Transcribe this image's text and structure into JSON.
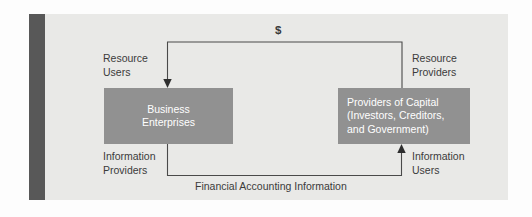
{
  "diagram": {
    "type": "flow-diagram",
    "colors": {
      "page_background": "#fdfdfd",
      "panel_background": "#e9e9e7",
      "accent_bar": "#585858",
      "node_fill": "#919191",
      "node_text": "#ffffff",
      "annotation_text": "#3b3b3b",
      "connector_line": "#4a4a4a"
    },
    "nodes": [
      {
        "id": "business-enterprises",
        "label": "Business\nEnterprises",
        "align": "center"
      },
      {
        "id": "providers-of-capital",
        "label": "Providers of Capital\n(Investors, Creditors,\nand Government)",
        "align": "left"
      }
    ],
    "annotations": {
      "resource_users": "Resource\nUsers",
      "resource_providers": "Resource\nProviders",
      "information_providers": "Information\nProviders",
      "information_users": "Information\nUsers",
      "money_flow": "$",
      "information_flow": "Financial Accounting Information"
    },
    "flows": [
      {
        "id": "capital-flow",
        "label": "$",
        "from": "providers-of-capital",
        "to": "business-enterprises",
        "from_role": "Resource Providers",
        "to_role": "Resource Users",
        "direction": "right-to-left-over-top"
      },
      {
        "id": "information-flow",
        "label": "Financial Accounting Information",
        "from": "business-enterprises",
        "to": "providers-of-capital",
        "from_role": "Information Providers",
        "to_role": "Information Users",
        "direction": "left-to-right-under-bottom"
      }
    ]
  }
}
